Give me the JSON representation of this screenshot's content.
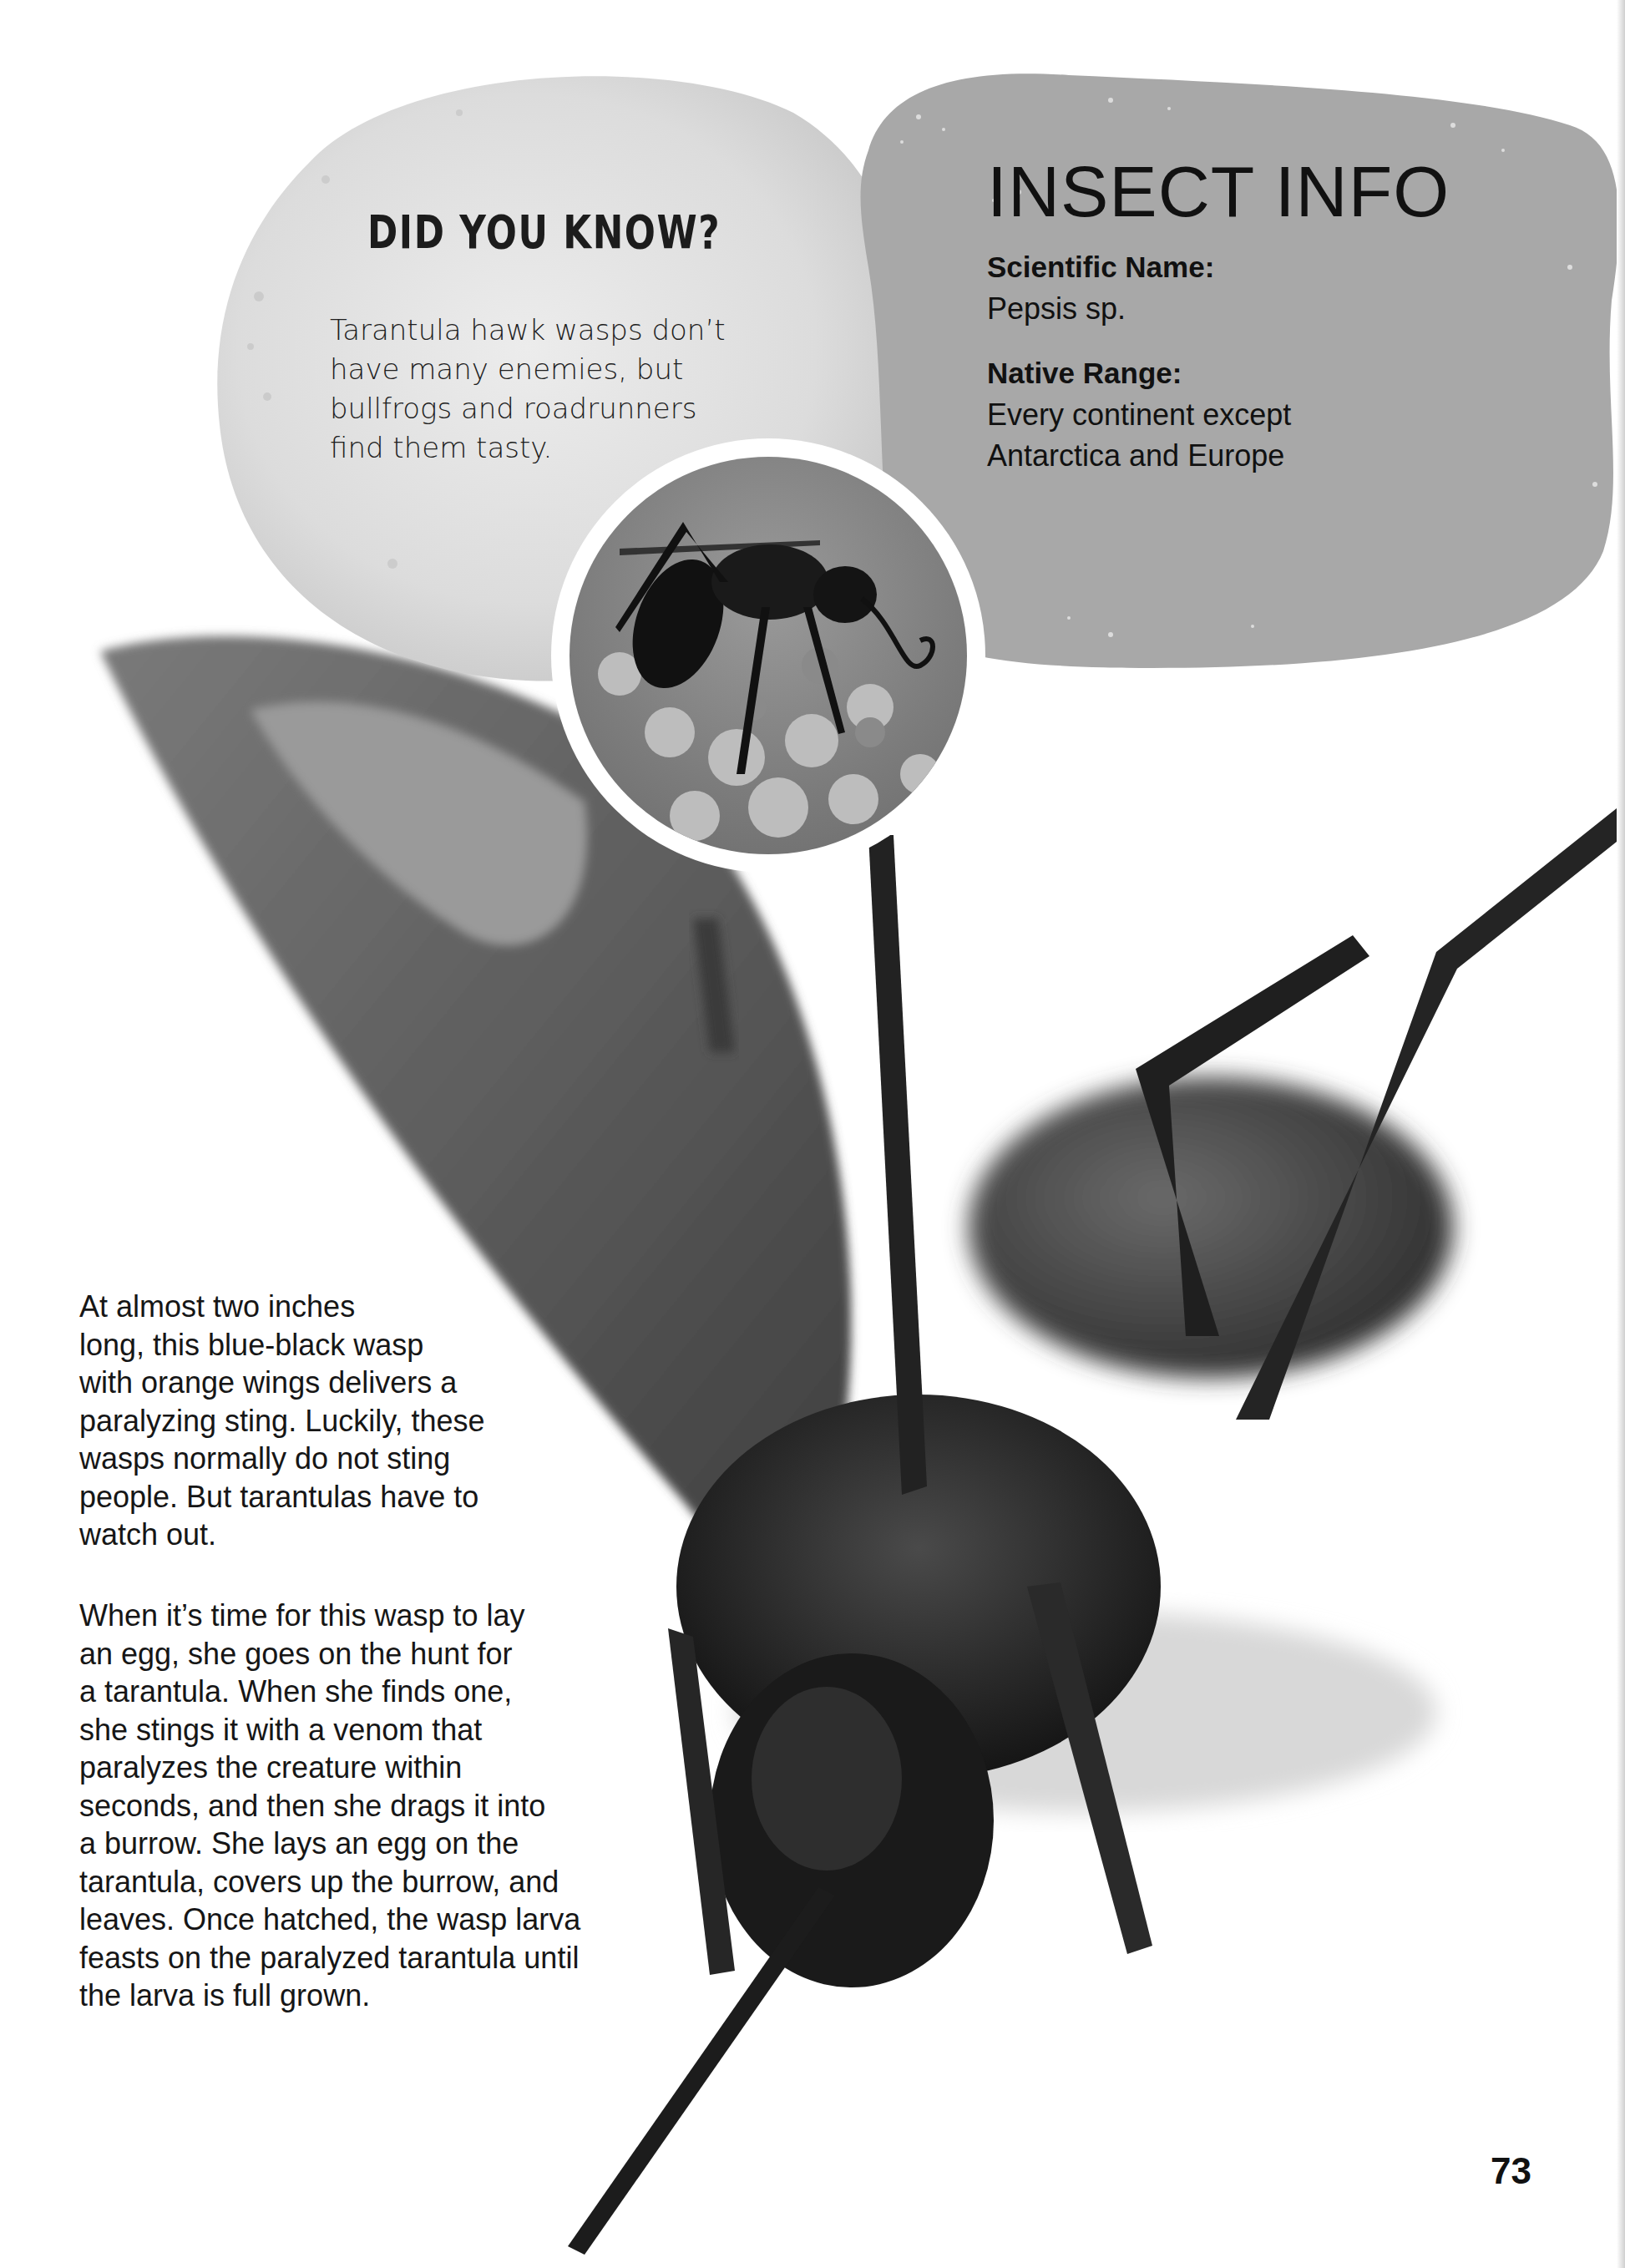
{
  "did_you_know": {
    "title": "DID YOU KNOW?",
    "lines": [
      "Tarantula hawk wasps don’t",
      "have many enemies, but",
      "bullfrogs and roadrunners",
      "find them tasty."
    ]
  },
  "insect_info": {
    "title": "INSECT INFO",
    "scientific_name_label": "Scientific Name:",
    "scientific_name_value": "Pepsis sp.",
    "native_range_label": "Native Range:",
    "native_range_lines": [
      "Every continent except",
      "Antarctica and Europe"
    ]
  },
  "body": {
    "paragraph_1": [
      "At almost two inches",
      "long, this blue-black wasp",
      "with orange wings delivers a",
      "paralyzing sting. Luckily, these",
      "wasps normally do not sting",
      "people. But tarantulas have to",
      "watch out."
    ],
    "paragraph_2": [
      "When it’s time for this wasp to lay",
      "an egg, she goes on the hunt for",
      "a tarantula. When she finds one,",
      "she stings it with a venom that",
      "paralyzes the creature within",
      "seconds, and then she drags it into",
      "a burrow. She lays an egg on the",
      "tarantula, covers up the burrow, and",
      "leaves. Once hatched, the wasp larva",
      "feasts on the paralyzed tarantula until",
      "the larva is full grown."
    ]
  },
  "images": {
    "hero": "tarantula-hawk-wasp-closeup",
    "inset": "wasp-on-milkweed-flowers"
  },
  "page_number": "73",
  "colors": {
    "info_blob": "#a8a8a8",
    "dyk_blob": "#dcdcdc",
    "text": "#161616"
  }
}
